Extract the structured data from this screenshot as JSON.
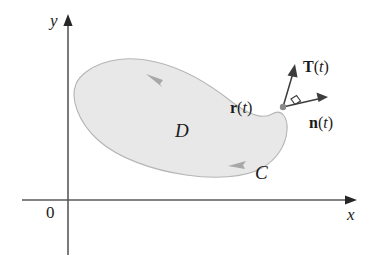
{
  "figure": {
    "axes": {
      "x_label": "x",
      "y_label": "y",
      "origin_label": "0",
      "axis_color": "#595959"
    },
    "region": {
      "label": "D",
      "fill_color": "#e8e8e8",
      "outline_color": "#b5b5b5"
    },
    "curve": {
      "label": "C",
      "orientation": "counterclockwise",
      "arrow_color": "#a8a8a8"
    },
    "vectors": [
      {
        "id": "tangent",
        "label_bold": "T",
        "label_paren_open": "(",
        "label_var": "t",
        "label_paren_close": ")",
        "color": "#3d3d3d"
      },
      {
        "id": "normal",
        "label_bold": "n",
        "label_paren_open": "(",
        "label_var": "t",
        "label_paren_close": ")",
        "color": "#3d3d3d"
      },
      {
        "id": "position",
        "label_bold": "r",
        "label_paren_open": "(",
        "label_var": "t",
        "label_paren_close": ")",
        "color": "#1a1a1a"
      }
    ],
    "point_marker": {
      "name": "curve-point",
      "color": "#8a8a8a"
    },
    "right_angle_marker": {
      "name": "right-angle-square",
      "color": "#3d3d3d"
    }
  }
}
